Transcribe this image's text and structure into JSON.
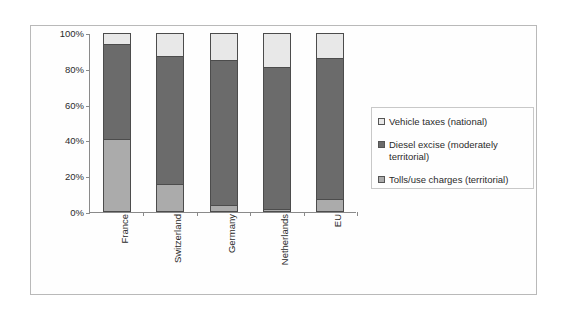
{
  "chart_data": {
    "type": "bar",
    "subtype": "stacked-percentage",
    "title": "",
    "xlabel": "",
    "ylabel": "",
    "ylim": [
      0,
      100
    ],
    "ytick_labels": [
      "100%",
      "80%",
      "60%",
      "40%",
      "20%",
      "0%"
    ],
    "ytick_values": [
      100,
      80,
      60,
      40,
      20,
      0
    ],
    "grid": false,
    "legend_position": "right",
    "categories": [
      "France",
      "Switzerland",
      "Germany",
      "Netherlands",
      "EU"
    ],
    "series": [
      {
        "name": "Tolls/use charges (territorial)",
        "color": "#ababab",
        "values": [
          41,
          15.5,
          4,
          1.5,
          7
        ]
      },
      {
        "name": "Diesel excise (moderately territorial)",
        "color": "#6b6b6b",
        "values": [
          53,
          71.5,
          81,
          79.5,
          79
        ]
      },
      {
        "name": "Vehicle taxes (national)",
        "color": "#e8e8e8",
        "values": [
          6,
          13,
          15,
          19,
          14
        ]
      }
    ],
    "stack_tops": {
      "tolls": [
        41,
        15.5,
        4,
        1.5,
        7
      ],
      "diesel": [
        94,
        87,
        85,
        81,
        86
      ],
      "vehicle": [
        100,
        100,
        100,
        100,
        100
      ]
    },
    "annotations": []
  },
  "legend": {
    "entries": [
      {
        "label": "Vehicle taxes (national)",
        "swatch": "#e8e8e8",
        "icon": "square-swatch-icon"
      },
      {
        "label": "Diesel excise (moderately territorial)",
        "swatch": "#6b6b6b",
        "icon": "square-swatch-icon"
      },
      {
        "label": "Tolls/use charges (territorial)",
        "swatch": "#ababab",
        "icon": "square-swatch-icon"
      }
    ]
  },
  "colors": {
    "vehicle_taxes": "#e8e8e8",
    "diesel_excise": "#6b6b6b",
    "tolls_use_charges": "#ababab",
    "axis": "#8a8a8a",
    "bar_outline": "#4c4c4c",
    "frame": "#b9b9b9",
    "text": "#2b2b2b",
    "background": "#ffffff"
  }
}
